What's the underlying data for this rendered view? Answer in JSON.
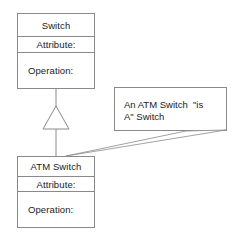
{
  "diagram": {
    "type": "uml-class-diagram",
    "background_color": "#ffffff",
    "line_color": "#8a8a8a",
    "text_color": "#1a1a1a",
    "classes": [
      {
        "id": "switch",
        "name": "Switch",
        "attributes_label": "Attribute:",
        "operations_label": "Operation:"
      },
      {
        "id": "atm-switch",
        "name": "ATM Switch",
        "attributes_label": "Attribute:",
        "operations_label": "Operation:"
      }
    ],
    "relationship": {
      "kind": "generalization",
      "from": "ATM Switch",
      "to": "Switch",
      "arrowhead": "hollow-triangle"
    },
    "note": {
      "line1": "An ATM Switch  \"is",
      "line2": "A\" Switch",
      "anchored_to": "ATM Switch"
    }
  }
}
